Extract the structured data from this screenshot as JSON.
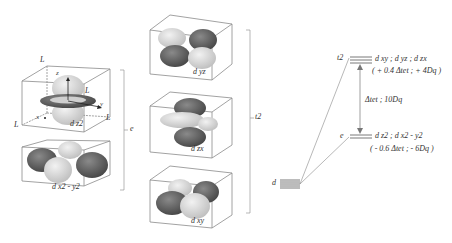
{
  "diagram": {
    "type": "tetrahedral crystal field splitting of d orbitals",
    "orbitals_e": [
      {
        "name": "dz2",
        "label": "d z2",
        "axis_labels": {
          "z": "z",
          "x": "x",
          "y": "y"
        },
        "ligand_label": "L"
      },
      {
        "name": "dx2-y2",
        "label": "d x2 - y2"
      }
    ],
    "orbitals_t2": [
      {
        "name": "dyz",
        "label": "d yz"
      },
      {
        "name": "dzx",
        "label": "d zx"
      },
      {
        "name": "dxy",
        "label": "d xy"
      }
    ],
    "group_labels": {
      "e": "e",
      "t2": "t2"
    },
    "energy_diagram": {
      "free_ion_label": "d",
      "t2_label": "t2",
      "t2_orbitals": "d xy ; d yz ; d zx",
      "t2_energy": "( + 0.4 Δtet ;  + 4Dq )",
      "gap_label": "Δtet ; 10Dq",
      "e_label": "e",
      "e_orbitals": "d z2 ; d x2 - y2",
      "e_energy": "( - 0.6 Δtet ;  - 6Dq )"
    },
    "colors": {
      "dark_lobe": "#5a5a5a",
      "light_lobe": "#d8d8d8",
      "box_line": "#8a8a8a",
      "text": "#333333"
    }
  }
}
